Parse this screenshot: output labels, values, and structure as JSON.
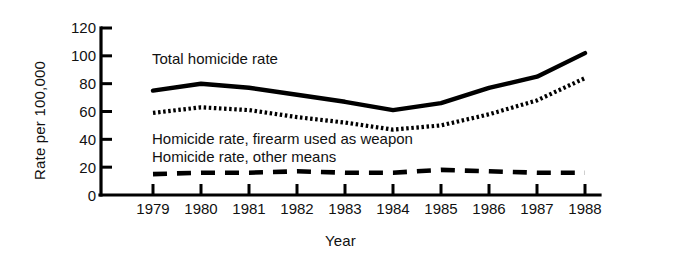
{
  "chart_data": {
    "type": "line",
    "title": "",
    "xlabel": "Year",
    "ylabel": "Rate per 100,000",
    "categories": [
      "1979",
      "1980",
      "1981",
      "1982",
      "1983",
      "1984",
      "1985",
      "1986",
      "1987",
      "1988"
    ],
    "x": [
      1979,
      1980,
      1981,
      1982,
      1983,
      1984,
      1985,
      1986,
      1987,
      1988
    ],
    "xlim": [
      1979,
      1988
    ],
    "ylim": [
      0,
      120
    ],
    "yticks": [
      0,
      20,
      40,
      60,
      80,
      100,
      120
    ],
    "ytick_labels": [
      "0",
      "20",
      "40",
      "60",
      "80",
      "100",
      "120"
    ],
    "grid": false,
    "legend_position": "inline-annotations",
    "series": [
      {
        "name": "Total homicide rate",
        "style": "solid",
        "color": "#000000",
        "values": [
          75,
          80,
          77,
          72,
          67,
          61,
          66,
          77,
          85,
          102
        ]
      },
      {
        "name": "Homicide rate, firearm used as weapon",
        "style": "dotted",
        "color": "#000000",
        "values": [
          59,
          63,
          61,
          56,
          52,
          47,
          50,
          58,
          68,
          84
        ]
      },
      {
        "name": "Homicide rate, other means",
        "style": "dashed",
        "color": "#000000",
        "values": [
          15,
          16,
          16,
          17,
          16,
          16,
          18,
          17,
          16,
          16
        ]
      }
    ],
    "annotations": [
      {
        "text": "Total homicide rate",
        "x": 1979.6,
        "y": 96
      },
      {
        "text": "Homicide rate, firearm used as weapon",
        "x": 1979.6,
        "y": 38
      },
      {
        "text": "Homicide rate, other means",
        "x": 1979.6,
        "y": 28
      }
    ]
  },
  "figure": {
    "background_color": "#ffffff",
    "axis_color": "#000000"
  }
}
